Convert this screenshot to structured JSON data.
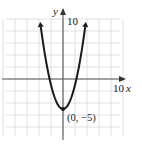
{
  "chart_data": {
    "type": "line",
    "title": "",
    "function": "y = x^2 - 5",
    "xlabel": "x",
    "ylabel": "y",
    "xlim": [
      -10,
      10
    ],
    "ylim": [
      -10,
      10
    ],
    "grid": true,
    "grid_step": 2,
    "tick_labels": {
      "x": [
        "10"
      ],
      "y": [
        "10"
      ]
    },
    "annotations": [
      {
        "text": "(0, −5)",
        "x": 0,
        "y": -5
      }
    ],
    "series": [
      {
        "name": "parabola",
        "x": [
          -3.8,
          -3,
          -2.24,
          -2,
          -1,
          0,
          1,
          2,
          2.24,
          3,
          3.8
        ],
        "y": [
          9.44,
          4,
          0,
          -1,
          -4,
          -5,
          -4,
          -1,
          0,
          4,
          9.44
        ]
      }
    ],
    "vertex": {
      "x": 0,
      "y": -5
    },
    "x_intercepts": [
      -2.24,
      2.24
    ],
    "colors": {
      "curve": "#1a1a1a",
      "axis": "#444444",
      "grid": "#d4d4d4"
    }
  },
  "labels": {
    "x_axis": "x",
    "y_axis": "y",
    "x_max": "10",
    "y_max": "10",
    "vertex": "(0, −5)"
  }
}
